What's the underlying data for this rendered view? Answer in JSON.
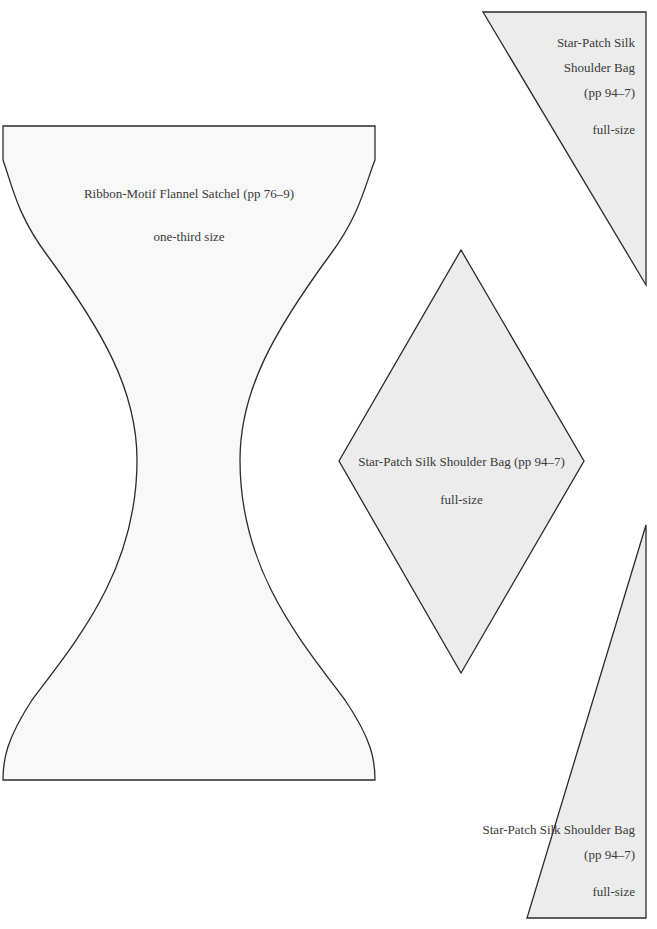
{
  "page": {
    "background": "#ffffff",
    "shape_fill_light": "#f8f8f8",
    "shape_fill_grey": "#ececec",
    "stroke": "#2b2b2b"
  },
  "templates": [
    {
      "id": "satchel",
      "shape": "hourglass-curved",
      "title": "Ribbon-Motif Flannel Satchel (pp 76–9)",
      "scale": "one-third size"
    },
    {
      "id": "triangle-top-right",
      "shape": "triangle",
      "title_lines": [
        "Star-Patch Silk",
        "Shoulder Bag",
        "(pp 94–7)"
      ],
      "scale": "full-size"
    },
    {
      "id": "diamond",
      "shape": "diamond",
      "title": "Star-Patch Silk Shoulder Bag (pp 94–7)",
      "scale": "full-size"
    },
    {
      "id": "triangle-bottom-right",
      "shape": "triangle",
      "title_lines": [
        "Star-Patch Silk Shoulder Bag",
        "(pp 94–7)"
      ],
      "scale": "full-size"
    }
  ]
}
